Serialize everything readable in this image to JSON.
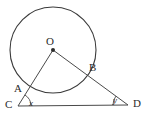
{
  "figure": {
    "type": "geometry-diagram",
    "background_color": "#ffffff",
    "stroke_color": "#3a3a3a",
    "text_color": "#2b2b2b",
    "circle": {
      "name": "main-circle",
      "center_label": "O",
      "center_x": 53,
      "center_y": 50,
      "radius": 43
    },
    "points": [
      {
        "id": "O",
        "label": "O",
        "x": 53,
        "y": 50,
        "label_x": 46,
        "label_y": 36,
        "dot": true
      },
      {
        "id": "B",
        "label": "B",
        "x": 86,
        "y": 68,
        "label_x": 89,
        "label_y": 62,
        "dot": false
      },
      {
        "id": "A",
        "label": "A",
        "x": 29,
        "y": 88,
        "label_x": 14,
        "label_y": 83,
        "dot": false
      },
      {
        "id": "C",
        "label": "C",
        "x": 18,
        "y": 106,
        "label_x": 5,
        "label_y": 99,
        "dot": false
      },
      {
        "id": "D",
        "label": "D",
        "x": 128,
        "y": 105,
        "label_x": 133,
        "label_y": 98,
        "dot": false
      }
    ],
    "segments": [
      {
        "id": "CO",
        "from": "C",
        "to": "O",
        "name": "segment-c-to-o"
      },
      {
        "id": "OD",
        "from": "O",
        "to": "D",
        "name": "segment-o-to-d"
      },
      {
        "id": "CD",
        "from": "C",
        "to": "D",
        "name": "segment-c-to-d"
      }
    ],
    "angles": [
      {
        "id": "x",
        "label": "x",
        "vertex": "C",
        "label_x": 29,
        "label_y": 99,
        "arc_radius": 13
      },
      {
        "id": "y",
        "label": "y",
        "vertex": "D",
        "label_x": 113,
        "label_y": 96,
        "arc_radius": 15
      }
    ]
  }
}
